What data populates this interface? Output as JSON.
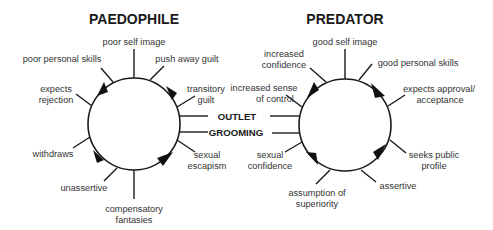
{
  "colors": {
    "line": "#1a1a1a",
    "text": "#333333",
    "background": "#ffffff"
  },
  "paedophile": {
    "title": "PAEDOPHILE",
    "labels": {
      "poor_self_image": "poor self image",
      "poor_personal_skills": "poor personal skills",
      "push_away_guilt": "push away guilt",
      "expects_rejection_1": "expects",
      "expects_rejection_2": "rejection",
      "transitory_guilt_1": "transitory",
      "transitory_guilt_2": "guilt",
      "withdraws": "withdraws",
      "sexual_escapism_1": "sexual",
      "sexual_escapism_2": "escapism",
      "unassertive": "unassertive",
      "compensatory_fantasies_1": "compensatory",
      "compensatory_fantasies_2": "fantasies"
    }
  },
  "predator": {
    "title": "PREDATOR",
    "labels": {
      "good_self_image": "good self image",
      "increased_confidence_1": "increased",
      "increased_confidence_2": "confidence",
      "good_personal_skills": "good personal skills",
      "increased_sense_of_control_1": "increased sense",
      "increased_sense_of_control_2": "of control",
      "expects_approval_1": "expects approval/",
      "expects_approval_2": "acceptance",
      "sexual_confidence_1": "sexual",
      "sexual_confidence_2": "confidence",
      "seeks_public_profile_1": "seeks public",
      "seeks_public_profile_2": "profile",
      "assumption_of_superiority_1": "assumption of",
      "assumption_of_superiority_2": "superiority",
      "assertive": "assertive"
    }
  },
  "connectors": {
    "outlet": "OUTLET",
    "grooming": "GROOMING"
  }
}
